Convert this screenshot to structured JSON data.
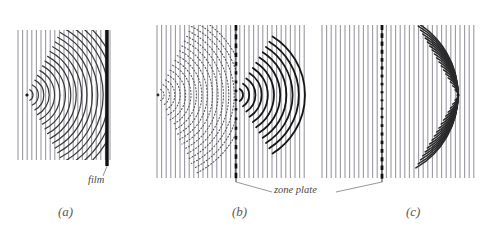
{
  "figure": {
    "kind": "optics-wave-diagram",
    "topic": "zone plate hologram recording and reconstruction",
    "background_color": "#ffffff",
    "width": 490,
    "height": 232
  },
  "annotations": {
    "film_label": "film",
    "zone_plate_label": "zone plate"
  },
  "panels": [
    {
      "id": "a",
      "caption": "(a)",
      "caption_x": 58,
      "caption_y": 204,
      "plane_wave": {
        "x_start": 18,
        "x_end": 110,
        "y_top": 30,
        "y_bottom": 160,
        "spacing": 4.6,
        "color": "#9a9aa2",
        "width": 1.1
      },
      "source": {
        "x": 27,
        "y": 95,
        "r": 1.6,
        "color": "#1a1a1a"
      },
      "arcs": {
        "center_x": 27,
        "center_y": 95,
        "count": 17,
        "r_start": 6,
        "r_step": 5.4,
        "half_angle_deg": 62,
        "color": "#3a3a3a",
        "width": 1.25,
        "style": "solid"
      },
      "barrier": {
        "type": "film",
        "x": 107,
        "y_top": 30,
        "y_bottom": 166,
        "width": 3.4,
        "color": "#111111",
        "segmented": false
      },
      "leader": {
        "x1": 107,
        "y1": 166,
        "x2": 103,
        "y2": 176
      }
    },
    {
      "id": "b",
      "caption": "(b)",
      "caption_x": 232,
      "caption_y": 204,
      "plane_wave": {
        "x_start": 157,
        "x_end": 306,
        "y_top": 25,
        "y_bottom": 178,
        "spacing": 4.6,
        "color": "#9a9aa2",
        "width": 1.1
      },
      "source": {
        "x": 158,
        "y": 95,
        "r": 1.4,
        "color": "#2a2a2a"
      },
      "arcs_left": {
        "center_x": 158,
        "center_y": 95,
        "count": 16,
        "r_start": 6,
        "r_step": 5.4,
        "half_angle_deg": 64,
        "color": "#5a5a5a",
        "width": 1.1,
        "style": "dotted"
      },
      "arcs_right": {
        "center_x": 236,
        "center_y": 95,
        "count": 11,
        "r_start": 7,
        "r_step": 6.2,
        "half_angle_deg": 58,
        "color": "#161616",
        "width": 1.8,
        "style": "solid"
      },
      "barrier": {
        "type": "zone-plate",
        "x": 236,
        "y_top": 25,
        "y_bottom": 182,
        "width": 2.6,
        "color": "#111111",
        "segmented": true,
        "segments": 17
      },
      "leader": {
        "x1": 236,
        "y1": 182,
        "x2": 272,
        "y2": 192
      }
    },
    {
      "id": "c",
      "caption": "(c)",
      "caption_x": 406,
      "caption_y": 204,
      "plane_wave": {
        "x_start": 322,
        "x_end": 478,
        "y_top": 25,
        "y_bottom": 178,
        "spacing": 4.6,
        "color": "#9a9aa2",
        "width": 1.1
      },
      "focus": {
        "x": 458,
        "y": 95,
        "r": 1.6,
        "color": "#1a1a1a"
      },
      "arcs": {
        "center_x": 458,
        "center_y": 95,
        "count": 18,
        "r_start": 6,
        "r_step": 4.6,
        "half_angle_deg": 60,
        "color": "#2a2a2a",
        "width": 1.5,
        "style": "solid",
        "opens": "left"
      },
      "barrier": {
        "type": "zone-plate",
        "x": 382,
        "y_top": 25,
        "y_bottom": 182,
        "width": 2.8,
        "color": "#111111",
        "segmented": true,
        "segments": 19
      },
      "leader": {
        "x1": 382,
        "y1": 182,
        "x2": 336,
        "y2": 192
      }
    }
  ]
}
